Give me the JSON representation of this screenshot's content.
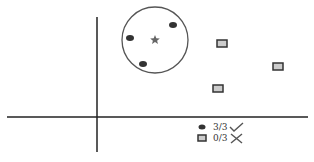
{
  "diagram": {
    "type": "cluster-illustration",
    "axes": {
      "color": "#222222"
    },
    "cluster": {
      "circle": {
        "cx": 155,
        "cy": 40,
        "r": 33,
        "stroke": "#555555"
      },
      "centroid_icon": "star",
      "points": [
        {
          "shape": "ellipse",
          "x": 130,
          "y": 38
        },
        {
          "shape": "ellipse",
          "x": 173,
          "y": 25
        },
        {
          "shape": "ellipse",
          "x": 143,
          "y": 64
        }
      ]
    },
    "outliers": [
      {
        "shape": "rectangle",
        "x": 222,
        "y": 44
      },
      {
        "shape": "rectangle",
        "x": 278,
        "y": 67
      },
      {
        "shape": "rectangle",
        "x": 218,
        "y": 89
      }
    ]
  },
  "legend": {
    "items": [
      {
        "marker": "ellipse",
        "label": "3/3",
        "status_icon": "check"
      },
      {
        "marker": "rectangle",
        "label": "0/3",
        "status_icon": "cross"
      }
    ]
  }
}
